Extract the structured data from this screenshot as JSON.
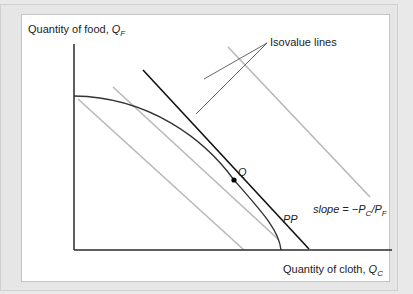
{
  "diagram": {
    "y_axis_label": "Quantity of food, ",
    "y_axis_var": "Q",
    "y_axis_sub": "F",
    "x_axis_label": "Quantity of cloth, ",
    "x_axis_var": "Q",
    "x_axis_sub": "C",
    "isovalue_label": "Isovalue lines",
    "point_label": "Q",
    "curve_label": "PP",
    "slope_label_prefix": "slope = −P",
    "slope_sub1": "C",
    "slope_mid": "/P",
    "slope_sub2": "F",
    "colors": {
      "axis": "#2a2a2a",
      "curve": "#333333",
      "tangent": "#111111",
      "isovalue": "#b8b8b8",
      "leader": "#555555",
      "background": "#ffffff",
      "frame": "#e6e6e6"
    }
  }
}
